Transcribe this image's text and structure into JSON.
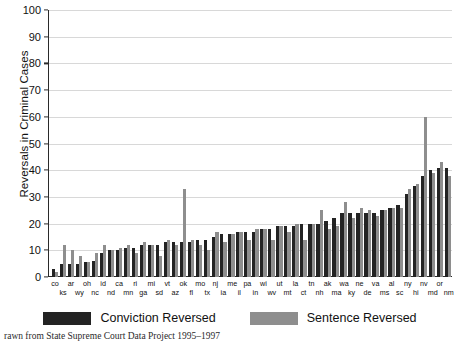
{
  "chart_data": {
    "type": "bar",
    "title": "",
    "xlabel": "",
    "ylabel": "Reversals in Criminal Cases",
    "ylim": [
      0,
      100
    ],
    "yticks": [
      0,
      10,
      20,
      30,
      40,
      50,
      60,
      70,
      80,
      90,
      100
    ],
    "grid": true,
    "legend_position": "bottom",
    "categories": [
      "co",
      "ks",
      "ar",
      "wy",
      "oh",
      "nc",
      "id",
      "nd",
      "ca",
      "mn",
      "ri",
      "ga",
      "mi",
      "sd",
      "vt",
      "az",
      "ok",
      "fl",
      "mo",
      "tx",
      "nj",
      "ia",
      "me",
      "il",
      "pa",
      "in",
      "wi",
      "wv",
      "ut",
      "mt",
      "la",
      "ct",
      "tn",
      "nh",
      "ak",
      "ma",
      "wa",
      "ky",
      "ne",
      "de",
      "va",
      "ms",
      "al",
      "sc",
      "ny",
      "hi",
      "nv",
      "md",
      "or",
      "nm"
    ],
    "series": [
      {
        "name": "Conviction Reversed",
        "color": "#232323",
        "values": [
          3,
          5,
          5,
          5,
          5.5,
          6,
          9,
          10,
          10,
          11,
          11,
          12,
          12,
          12,
          13,
          13,
          13,
          13,
          14,
          14,
          15,
          16,
          16,
          17,
          17,
          17,
          18,
          18,
          19,
          19,
          19,
          20,
          20,
          20,
          21,
          22,
          24,
          24,
          24,
          24,
          24,
          25,
          26,
          27,
          31,
          34,
          38,
          40,
          41,
          41
        ]
      },
      {
        "name": "Sentence Reversed",
        "color": "#8e8e8e",
        "values": [
          2,
          12,
          10,
          8,
          5.5,
          9,
          12,
          10,
          11,
          12,
          9,
          13,
          12,
          8,
          14,
          12,
          33,
          14,
          12,
          10,
          17,
          13,
          16,
          17,
          14,
          18,
          18,
          14,
          19,
          17,
          20,
          14,
          20,
          25,
          18,
          19,
          28,
          22,
          26,
          25,
          23,
          25,
          26,
          26,
          33,
          35,
          60,
          39,
          43,
          38
        ]
      }
    ],
    "xlabel_rows": {
      "top": [
        "co",
        "",
        "ar",
        "",
        "oh",
        "",
        "id",
        "",
        "ca",
        "",
        "ri",
        "",
        "mi",
        "",
        "vt",
        "",
        "ok",
        "",
        "mo",
        "",
        "nj",
        "",
        "me",
        "",
        "pa",
        "",
        "wi",
        "",
        "ut",
        "",
        "la",
        "",
        "tn",
        "",
        "ak",
        "",
        "wa",
        "",
        "ne",
        "",
        "va",
        "",
        "al",
        "",
        "ny",
        "",
        "nv",
        "",
        "or",
        ""
      ],
      "bottom": [
        "",
        "ks",
        "",
        "wy",
        "",
        "nc",
        "",
        "nd",
        "",
        "mn",
        "",
        "ga",
        "",
        "sd",
        "",
        "az",
        "",
        "fl",
        "",
        "tx",
        "",
        "ia",
        "",
        "il",
        "",
        "in",
        "",
        "wv",
        "",
        "mt",
        "",
        "ct",
        "",
        "nh",
        "",
        "ma",
        "",
        "ky",
        "",
        "de",
        "",
        "ms",
        "",
        "sc",
        "",
        "hi",
        "",
        "md",
        "",
        "nm"
      ]
    }
  },
  "legend": {
    "items": [
      {
        "label": "Conviction Reversed",
        "color": "#232323",
        "swatch": "conviction-swatch"
      },
      {
        "label": "Sentence Reversed",
        "color": "#8e8e8e",
        "swatch": "sentence-swatch"
      }
    ]
  },
  "footer": {
    "caption": "rawn from State Supreme Court Data Project 1995–1997"
  }
}
